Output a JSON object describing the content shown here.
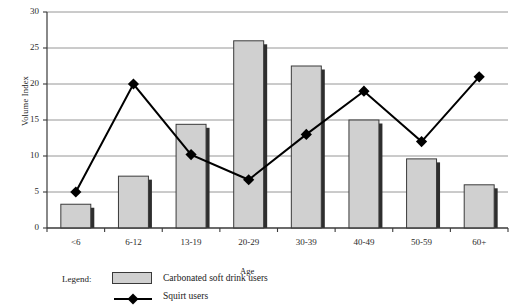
{
  "chart_data": {
    "type": "bar",
    "title": "",
    "xlabel": "Age",
    "ylabel": "Volume Index",
    "categories": [
      "<6",
      "6-12",
      "13-19",
      "20-29",
      "30-39",
      "40-49",
      "50-59",
      "60+"
    ],
    "ylim": [
      0,
      30
    ],
    "yticks": [
      0,
      5,
      10,
      15,
      20,
      25,
      30
    ],
    "grid": "horizontal",
    "legend_position": "bottom-left",
    "series": [
      {
        "name": "Carbonated soft drink users",
        "type": "bar",
        "color": "#d0d0d0",
        "edge_color": "#3a3a3a",
        "values": [
          3.3,
          7.2,
          14.4,
          26.0,
          22.5,
          15.0,
          9.6,
          6.0
        ]
      },
      {
        "name": "Squirt users",
        "type": "line",
        "color": "#000000",
        "marker": "diamond",
        "values": [
          5.0,
          20.0,
          10.2,
          6.7,
          13.0,
          19.0,
          12.0,
          21.0
        ]
      }
    ]
  },
  "axes": {
    "ylabel": "Volume Index",
    "xlabel": "Age",
    "ytick_labels": [
      "0",
      "5",
      "10",
      "15",
      "20",
      "25",
      "30"
    ],
    "xtick_labels": [
      "<6",
      "6-12",
      "13-19",
      "20-29",
      "30-39",
      "40-49",
      "50-59",
      "60+"
    ]
  },
  "legend": {
    "title": "Legend:",
    "bar_label": "Carbonated soft drink users",
    "line_label": "Squirt users"
  }
}
